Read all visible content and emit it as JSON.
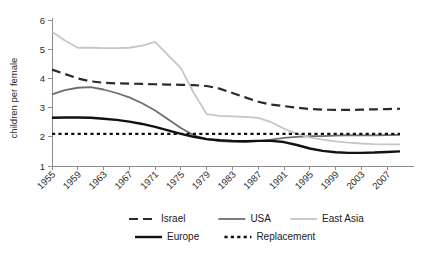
{
  "chart_data": {
    "type": "line",
    "title": "",
    "xlabel": "",
    "ylabel": "children per female",
    "xlim": [
      1955,
      2009
    ],
    "ylim": [
      1,
      6
    ],
    "grid": false,
    "legend_position": "bottom",
    "x_ticks": [
      "1955",
      "1959",
      "1963",
      "1967",
      "1971",
      "1975",
      "1979",
      "1983",
      "1987",
      "1991",
      "1995",
      "1999",
      "2003",
      "2007"
    ],
    "y_ticks": [
      "1",
      "2",
      "3",
      "4",
      "5",
      "6"
    ],
    "x": [
      1955,
      1957,
      1959,
      1961,
      1963,
      1965,
      1967,
      1969,
      1971,
      1973,
      1975,
      1977,
      1979,
      1981,
      1983,
      1985,
      1987,
      1989,
      1991,
      1993,
      1995,
      1997,
      1999,
      2001,
      2003,
      2005,
      2007,
      2009
    ],
    "series": [
      {
        "name": "Israel",
        "style": "dashed",
        "color": "#2b2b2b",
        "values": [
          4.3,
          4.15,
          4.0,
          3.9,
          3.85,
          3.83,
          3.82,
          3.81,
          3.8,
          3.79,
          3.78,
          3.77,
          3.74,
          3.65,
          3.5,
          3.35,
          3.2,
          3.1,
          3.05,
          3.0,
          2.95,
          2.93,
          2.92,
          2.92,
          2.93,
          2.94,
          2.95,
          2.96
        ]
      },
      {
        "name": "USA",
        "style": "solid",
        "color": "#6e6e6e",
        "values": [
          3.45,
          3.6,
          3.68,
          3.7,
          3.62,
          3.5,
          3.35,
          3.15,
          2.9,
          2.6,
          2.3,
          2.05,
          1.92,
          1.85,
          1.83,
          1.83,
          1.85,
          1.9,
          1.96,
          2.0,
          2.02,
          2.02,
          2.04,
          2.06,
          2.05,
          2.05,
          2.06,
          2.07
        ]
      },
      {
        "name": "East Asia",
        "style": "solid",
        "color": "#c6c6c6",
        "values": [
          5.6,
          5.3,
          5.05,
          5.05,
          5.04,
          5.04,
          5.05,
          5.12,
          5.25,
          4.8,
          4.35,
          3.5,
          2.78,
          2.72,
          2.7,
          2.68,
          2.65,
          2.5,
          2.28,
          2.1,
          1.98,
          1.9,
          1.84,
          1.8,
          1.77,
          1.75,
          1.74,
          1.74
        ]
      },
      {
        "name": "Europe",
        "style": "solid-thick",
        "color": "#111111",
        "values": [
          2.65,
          2.66,
          2.66,
          2.65,
          2.62,
          2.58,
          2.52,
          2.44,
          2.34,
          2.22,
          2.1,
          2.0,
          1.92,
          1.88,
          1.86,
          1.85,
          1.86,
          1.86,
          1.82,
          1.72,
          1.6,
          1.52,
          1.47,
          1.45,
          1.45,
          1.46,
          1.48,
          1.5
        ]
      },
      {
        "name": "Replacement",
        "style": "dotted",
        "color": "#111111",
        "values": [
          2.1,
          2.1,
          2.1,
          2.1,
          2.1,
          2.1,
          2.1,
          2.1,
          2.1,
          2.1,
          2.1,
          2.1,
          2.1,
          2.1,
          2.1,
          2.1,
          2.1,
          2.1,
          2.1,
          2.1,
          2.1,
          2.1,
          2.1,
          2.1,
          2.1,
          2.1,
          2.1,
          2.1
        ]
      }
    ],
    "legend": [
      {
        "label": "Israel",
        "color": "#2b2b2b",
        "style": "dashed"
      },
      {
        "label": "USA",
        "color": "#6e6e6e",
        "style": "solid"
      },
      {
        "label": "East Asia",
        "color": "#c6c6c6",
        "style": "solid"
      },
      {
        "label": "Europe",
        "color": "#111111",
        "style": "solid-thick"
      },
      {
        "label": "Replacement",
        "color": "#111111",
        "style": "dotted"
      }
    ]
  }
}
